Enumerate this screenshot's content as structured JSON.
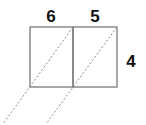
{
  "diagram": {
    "labels": {
      "left_width": "6",
      "right_width": "5",
      "height": "4"
    },
    "colors": {
      "outline": "#7a7a7a",
      "dashed": "#8a8a8a",
      "text": "#111111"
    }
  }
}
